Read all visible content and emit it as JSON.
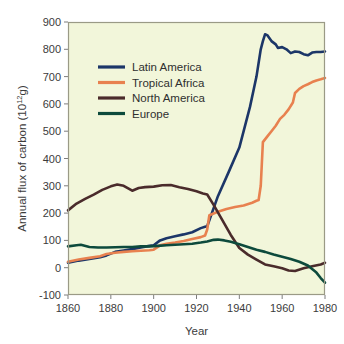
{
  "chart_data": {
    "type": "line",
    "title": "",
    "xlabel": "Year",
    "ylabel": "Annual flux of carbon (10",
    "ylabel_sup": "12",
    "ylabel_tail": "g)",
    "ylabel_full": "Annual flux of carbon (10^12 g)",
    "xlim": [
      1860,
      1980
    ],
    "ylim": [
      -100,
      900
    ],
    "xticks": [
      1860,
      1880,
      1900,
      1920,
      1940,
      1960,
      1980
    ],
    "xtick_labels": [
      "1860",
      "1880",
      "1900",
      "1920",
      "1940",
      "1960",
      "1980"
    ],
    "yticks": [
      -100,
      0,
      100,
      200,
      300,
      400,
      500,
      600,
      700,
      800,
      900
    ],
    "ytick_labels": [
      "-100",
      "0",
      "100",
      "200",
      "300",
      "400",
      "500",
      "600",
      "700",
      "800",
      "900"
    ],
    "grid": false,
    "legend_position": "upper-left-inside",
    "plot_background": "#f2f6da",
    "frame_color": "#9a9a86",
    "series": [
      {
        "name": "Latin America",
        "color": "#1c3668",
        "x": [
          1860,
          1865,
          1870,
          1875,
          1878,
          1882,
          1886,
          1890,
          1894,
          1898,
          1900,
          1903,
          1906,
          1910,
          1914,
          1918,
          1922,
          1924,
          1925,
          1930,
          1935,
          1940,
          1945,
          1948,
          1950,
          1951,
          1952,
          1953,
          1955,
          1957,
          1958,
          1960,
          1962,
          1964,
          1966,
          1968,
          1970,
          1972,
          1974,
          1976,
          1978,
          1980
        ],
        "y": [
          18,
          26,
          32,
          38,
          45,
          58,
          63,
          68,
          74,
          80,
          82,
          100,
          108,
          115,
          122,
          130,
          145,
          150,
          152,
          262,
          350,
          440,
          590,
          700,
          800,
          830,
          855,
          852,
          830,
          818,
          805,
          808,
          800,
          786,
          792,
          790,
          782,
          778,
          788,
          790,
          790,
          792
        ]
      },
      {
        "name": "Tropical Africa",
        "color": "#e8814f",
        "x": [
          1860,
          1865,
          1870,
          1875,
          1878,
          1882,
          1886,
          1890,
          1894,
          1898,
          1900,
          1903,
          1906,
          1910,
          1914,
          1918,
          1922,
          1924,
          1925,
          1926,
          1930,
          1934,
          1938,
          1942,
          1946,
          1948,
          1949,
          1950,
          1951,
          1953,
          1955,
          1957,
          1959,
          1961,
          1963,
          1965,
          1966,
          1968,
          1970,
          1972,
          1974,
          1976,
          1978,
          1980
        ],
        "y": [
          22,
          30,
          36,
          42,
          50,
          55,
          58,
          60,
          62,
          64,
          66,
          82,
          88,
          92,
          98,
          105,
          112,
          118,
          140,
          192,
          205,
          215,
          222,
          228,
          238,
          245,
          248,
          300,
          460,
          480,
          500,
          520,
          545,
          560,
          580,
          605,
          640,
          655,
          665,
          672,
          680,
          686,
          690,
          695
        ]
      },
      {
        "name": "North America",
        "color": "#4a2b2b",
        "x": [
          1860,
          1864,
          1868,
          1872,
          1876,
          1880,
          1883,
          1886,
          1890,
          1893,
          1896,
          1900,
          1904,
          1908,
          1912,
          1916,
          1920,
          1923,
          1925,
          1928,
          1932,
          1936,
          1940,
          1944,
          1948,
          1952,
          1956,
          1960,
          1963,
          1966,
          1970,
          1974,
          1978,
          1980
        ],
        "y": [
          210,
          235,
          252,
          268,
          285,
          298,
          305,
          300,
          282,
          292,
          295,
          297,
          302,
          303,
          295,
          288,
          280,
          272,
          268,
          230,
          175,
          120,
          72,
          48,
          30,
          12,
          5,
          -2,
          -10,
          -12,
          -2,
          5,
          12,
          18
        ]
      },
      {
        "name": "Europe",
        "color": "#0d4a3c",
        "x": [
          1860,
          1864,
          1866,
          1870,
          1874,
          1878,
          1882,
          1886,
          1890,
          1894,
          1898,
          1902,
          1906,
          1910,
          1914,
          1918,
          1922,
          1925,
          1928,
          1930,
          1933,
          1936,
          1940,
          1944,
          1948,
          1952,
          1956,
          1960,
          1964,
          1968,
          1972,
          1976,
          1978,
          1980
        ],
        "y": [
          78,
          82,
          84,
          76,
          74,
          74,
          75,
          76,
          76,
          78,
          78,
          80,
          82,
          84,
          86,
          88,
          92,
          96,
          102,
          103,
          100,
          95,
          86,
          76,
          66,
          58,
          48,
          40,
          32,
          22,
          8,
          -18,
          -38,
          -55
        ]
      }
    ]
  },
  "legend": {
    "items": [
      {
        "label": "Latin America",
        "color": "#1c3668"
      },
      {
        "label": "Tropical Africa",
        "color": "#e8814f"
      },
      {
        "label": "North America",
        "color": "#4a2b2b"
      },
      {
        "label": "Europe",
        "color": "#0d4a3c"
      }
    ]
  }
}
